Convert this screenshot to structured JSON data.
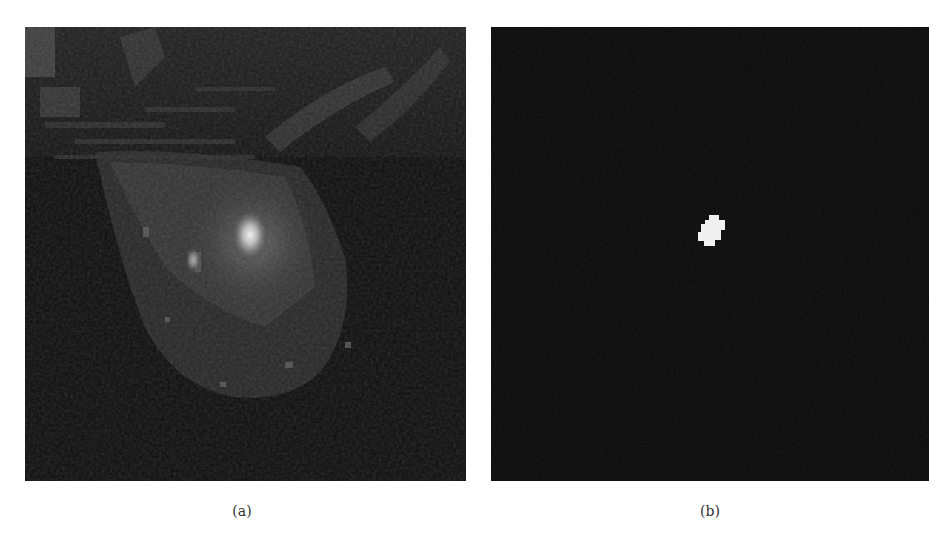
{
  "figure": {
    "panels": [
      {
        "id": "a",
        "caption": "(a)",
        "content": "grayscale breast MRI slice with a bright lesion region",
        "colors": {
          "background": "#0d0d0d",
          "tissue": "#3a3a3a",
          "lesion": "#e8e8e8"
        }
      },
      {
        "id": "b",
        "caption": "(b)",
        "content": "binary segmentation mask showing a small white lesion region",
        "colors": {
          "background": "#0b0b0b",
          "mask": "#f2f2f2"
        }
      }
    ]
  }
}
